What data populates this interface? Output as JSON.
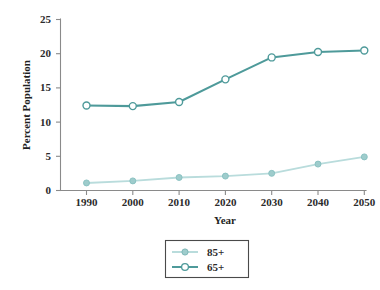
{
  "chart_data": {
    "type": "line",
    "title": "",
    "xlabel": "Year",
    "ylabel": "Percent Population",
    "categories": [
      "1990",
      "2000",
      "2010",
      "2020",
      "2030",
      "2040",
      "2050"
    ],
    "x": [
      1990,
      2000,
      2010,
      2020,
      2030,
      2040,
      2050
    ],
    "xlim": [
      1985,
      2055
    ],
    "ylim": [
      0,
      25
    ],
    "yticks": [
      0,
      5,
      10,
      15,
      20,
      25
    ],
    "ytick_labels": [
      "0",
      "5",
      "10",
      "15",
      "20",
      "25"
    ],
    "grid": false,
    "legend_position": "bottom-center",
    "series": [
      {
        "name": "85+",
        "color": "#b9dcdc",
        "marker": "filled-circle",
        "values": [
          1.1,
          1.4,
          1.9,
          2.1,
          2.5,
          3.85,
          4.9
        ]
      },
      {
        "name": "65+",
        "color": "#4e9a9a",
        "marker": "open-circle",
        "values": [
          12.4,
          12.3,
          12.9,
          16.2,
          19.4,
          20.2,
          20.4
        ]
      }
    ]
  },
  "axes": {
    "ylabel": "Percent Population",
    "xlabel": "Year",
    "ytick_labels": [
      "25",
      "20",
      "15",
      "10",
      "5",
      "0"
    ],
    "xtick_labels": [
      "1990",
      "2000",
      "2010",
      "2020",
      "2030",
      "2040",
      "2050"
    ]
  },
  "legend": {
    "entries": [
      {
        "label": "85+",
        "color": "#b9dcdc",
        "marker": "filled-circle"
      },
      {
        "label": "65+",
        "color": "#4e9a9a",
        "marker": "open-circle"
      }
    ]
  },
  "colors": {
    "series_85": "#b9dcdc",
    "series_65": "#4e9a9a",
    "axis": "#8a8a8a",
    "text": "#2b2b2b",
    "background": "#ffffff"
  }
}
